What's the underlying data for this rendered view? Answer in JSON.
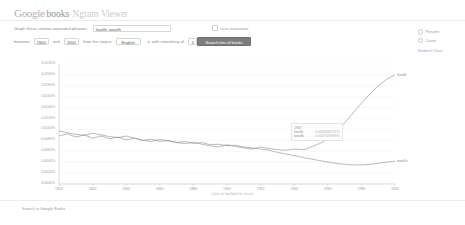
{
  "header": {
    "logo_google": "Google",
    "logo_books": "books",
    "logo_ngram": "Ngram Viewer"
  },
  "query_row": {
    "label": "Graph these comma-separated phrases:",
    "value": "health, wealth",
    "placeholder": "health, wealth",
    "case_insensitive_label": "case-insensitive"
  },
  "options_row": {
    "between_label": "between",
    "year_start": "1800",
    "and_label": "and",
    "year_end": "2000",
    "corpus_label": "from the corpus",
    "corpus_value": "English",
    "smoothing_label": "with smoothing of",
    "smoothing_value": "3",
    "search_button": "Search lots of books"
  },
  "side_panel": {
    "option_percent": "Percent",
    "option_count": "Count",
    "embed_chart": "Embed Chart"
  },
  "tooltip": {
    "year": "1947",
    "rows": [
      {
        "name": "health",
        "value": "0.0063580737%"
      },
      {
        "name": "wealth",
        "value": "0.0047383699%"
      }
    ]
  },
  "footer": {
    "search_books": "Search in Google Books"
  },
  "chart_data": {
    "type": "line",
    "title": "",
    "xlabel": "(click on line/label for focus)",
    "ylabel": "",
    "xlim": [
      1800,
      2000
    ],
    "ylim": [
      0,
      0.022
    ],
    "grid": true,
    "legend_position": "right-inline",
    "xticks": [
      "1800",
      "1820",
      "1840",
      "1860",
      "1880",
      "1900",
      "1920",
      "1940",
      "1960",
      "1980",
      "2000"
    ],
    "yticks": [
      "0.0220%",
      "0.0200%",
      "0.0180%",
      "0.0160%",
      "0.0140%",
      "0.0120%",
      "0.0100%",
      "0.0080%",
      "0.0060%",
      "0.0040%",
      "0.0020%",
      "0.0000%"
    ],
    "series": [
      {
        "name": "health",
        "color": "#8c8c8c",
        "x": [
          1800,
          1805,
          1810,
          1815,
          1820,
          1825,
          1830,
          1835,
          1840,
          1845,
          1850,
          1855,
          1860,
          1865,
          1870,
          1875,
          1880,
          1885,
          1890,
          1895,
          1900,
          1905,
          1910,
          1915,
          1920,
          1925,
          1930,
          1935,
          1940,
          1945,
          1947,
          1950,
          1955,
          1960,
          1965,
          1970,
          1975,
          1980,
          1985,
          1990,
          1995,
          2000
        ],
        "y": [
          0.0097,
          0.0094,
          0.0091,
          0.0089,
          0.0093,
          0.009,
          0.0087,
          0.0085,
          0.0088,
          0.0084,
          0.008,
          0.0078,
          0.0082,
          0.0079,
          0.0076,
          0.0074,
          0.0077,
          0.0073,
          0.007,
          0.0068,
          0.0072,
          0.0069,
          0.0066,
          0.0064,
          0.0068,
          0.0065,
          0.0063,
          0.0062,
          0.0064,
          0.0063,
          0.00636,
          0.0068,
          0.0074,
          0.0082,
          0.0095,
          0.0112,
          0.013,
          0.0148,
          0.0165,
          0.018,
          0.0192,
          0.02
        ]
      },
      {
        "name": "wealth",
        "color": "#8c8c8c",
        "x": [
          1800,
          1805,
          1810,
          1815,
          1820,
          1825,
          1830,
          1835,
          1840,
          1845,
          1850,
          1855,
          1860,
          1865,
          1870,
          1875,
          1880,
          1885,
          1890,
          1895,
          1900,
          1905,
          1910,
          1915,
          1920,
          1925,
          1930,
          1935,
          1940,
          1945,
          1947,
          1950,
          1955,
          1960,
          1965,
          1970,
          1975,
          1980,
          1985,
          1990,
          1995,
          2000
        ],
        "y": [
          0.0088,
          0.0092,
          0.0086,
          0.009,
          0.0084,
          0.0088,
          0.0083,
          0.0086,
          0.0081,
          0.0084,
          0.008,
          0.0082,
          0.0078,
          0.008,
          0.0076,
          0.0078,
          0.0074,
          0.0076,
          0.0072,
          0.0073,
          0.007,
          0.0071,
          0.0068,
          0.0066,
          0.0064,
          0.0062,
          0.0058,
          0.0055,
          0.0052,
          0.0049,
          0.00474,
          0.0046,
          0.0043,
          0.004,
          0.0038,
          0.0036,
          0.0035,
          0.0035,
          0.0036,
          0.0038,
          0.004,
          0.0042
        ]
      }
    ]
  }
}
